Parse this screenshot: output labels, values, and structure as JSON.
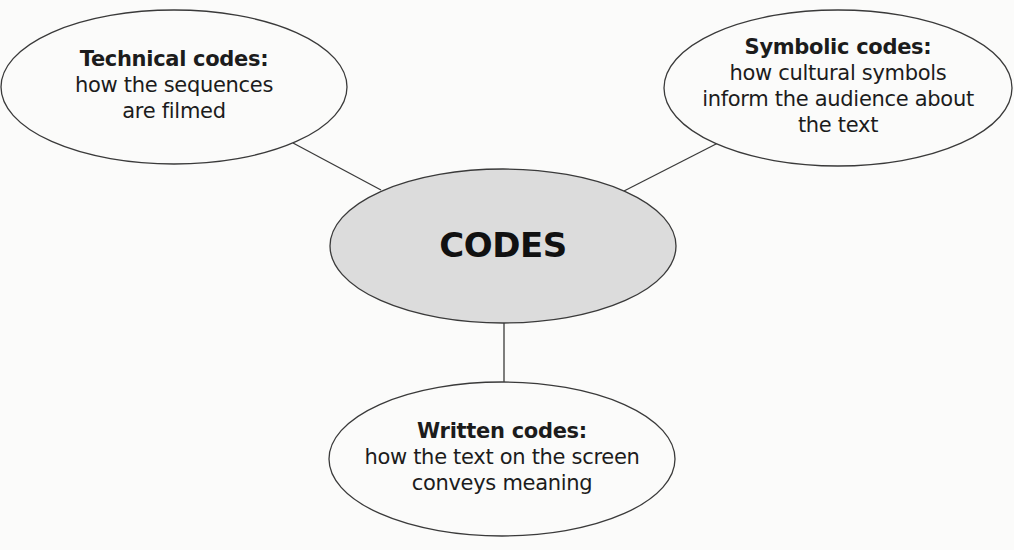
{
  "diagram": {
    "type": "mind-map",
    "center": {
      "label": "CODES",
      "fill": "#dcdcdc"
    },
    "nodes": [
      {
        "id": "technical",
        "title": "Technical codes:",
        "description_lines": [
          "how the sequences",
          "are filmed"
        ]
      },
      {
        "id": "symbolic",
        "title": "Symbolic codes:",
        "description_lines": [
          "how cultural symbols",
          "inform the audience about",
          "the text"
        ]
      },
      {
        "id": "written",
        "title": "Written codes:",
        "description_lines": [
          "how the text on the screen",
          "conveys meaning"
        ]
      }
    ],
    "edges": [
      {
        "from": "CODES",
        "to": "technical"
      },
      {
        "from": "CODES",
        "to": "symbolic"
      },
      {
        "from": "CODES",
        "to": "written"
      }
    ],
    "colors": {
      "outline": "#3a3a3a",
      "node_fill": "#fbfbfa",
      "center_fill": "#dcdcdc",
      "background": "#fbfbfa"
    }
  }
}
